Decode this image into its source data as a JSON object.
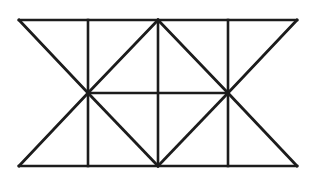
{
  "figure": {
    "canvas": {
      "width": 316,
      "height": 181,
      "background": "#ffffff"
    },
    "style": {
      "stroke_color": "#1c1c1c",
      "stroke_width": 2.6,
      "diagonal_stroke_width": 2.8
    },
    "geometry": {
      "x_stations": [
        19,
        88,
        158,
        228,
        297
      ],
      "y_stations": [
        20,
        93,
        166
      ],
      "x_labels": [
        "left-edge",
        "left-hub",
        "center",
        "right-hub",
        "right-edge"
      ],
      "y_labels": [
        "top-chord",
        "mid-chord",
        "bottom-chord"
      ]
    },
    "nodes": [
      {
        "name": "top-left-corner",
        "x": 19,
        "y": 20
      },
      {
        "name": "top-left-inner",
        "x": 88,
        "y": 20
      },
      {
        "name": "top-center",
        "x": 158,
        "y": 20
      },
      {
        "name": "top-right-inner",
        "x": 228,
        "y": 20
      },
      {
        "name": "top-right-corner",
        "x": 297,
        "y": 20
      },
      {
        "name": "left-hub",
        "x": 88,
        "y": 93
      },
      {
        "name": "mid-center",
        "x": 158,
        "y": 93
      },
      {
        "name": "right-hub",
        "x": 228,
        "y": 93
      },
      {
        "name": "bottom-left-corner",
        "x": 19,
        "y": 166
      },
      {
        "name": "bottom-left-inner",
        "x": 88,
        "y": 166
      },
      {
        "name": "bottom-center",
        "x": 158,
        "y": 166
      },
      {
        "name": "bottom-right-inner",
        "x": 228,
        "y": 166
      },
      {
        "name": "bottom-right-corner",
        "x": 297,
        "y": 166
      }
    ],
    "edges": [
      {
        "name": "top-chord",
        "kind": "horizontal",
        "x1": 19,
        "y1": 20,
        "x2": 297,
        "y2": 20
      },
      {
        "name": "bottom-chord",
        "kind": "horizontal",
        "x1": 19,
        "y1": 166,
        "x2": 297,
        "y2": 166
      },
      {
        "name": "mid-chord",
        "kind": "horizontal",
        "x1": 88,
        "y1": 93,
        "x2": 228,
        "y2": 93
      },
      {
        "name": "left-post",
        "kind": "vertical",
        "x1": 88,
        "y1": 20,
        "x2": 88,
        "y2": 166
      },
      {
        "name": "center-post",
        "kind": "vertical",
        "x1": 158,
        "y1": 20,
        "x2": 158,
        "y2": 166
      },
      {
        "name": "right-post",
        "kind": "vertical",
        "x1": 228,
        "y1": 20,
        "x2": 228,
        "y2": 166
      },
      {
        "name": "diag-upper-far-left",
        "kind": "diagonal",
        "x1": 19,
        "y1": 20,
        "x2": 88,
        "y2": 93
      },
      {
        "name": "diag-upper-left",
        "kind": "diagonal",
        "x1": 88,
        "y1": 93,
        "x2": 158,
        "y2": 20
      },
      {
        "name": "diag-upper-right",
        "kind": "diagonal",
        "x1": 158,
        "y1": 20,
        "x2": 228,
        "y2": 93
      },
      {
        "name": "diag-upper-far-right",
        "kind": "diagonal",
        "x1": 228,
        "y1": 93,
        "x2": 297,
        "y2": 20
      },
      {
        "name": "diag-lower-far-left",
        "kind": "diagonal",
        "x1": 19,
        "y1": 166,
        "x2": 88,
        "y2": 93
      },
      {
        "name": "diag-lower-left",
        "kind": "diagonal",
        "x1": 88,
        "y1": 93,
        "x2": 158,
        "y2": 166
      },
      {
        "name": "diag-lower-right",
        "kind": "diagonal",
        "x1": 158,
        "y1": 166,
        "x2": 228,
        "y2": 93
      },
      {
        "name": "diag-lower-far-right",
        "kind": "diagonal",
        "x1": 228,
        "y1": 93,
        "x2": 297,
        "y2": 166
      }
    ]
  }
}
